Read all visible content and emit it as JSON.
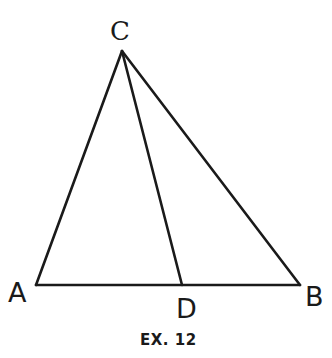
{
  "diagram": {
    "caption": "EX. 12",
    "points": {
      "A": {
        "label": "A",
        "x": 36,
        "y": 285
      },
      "B": {
        "label": "B",
        "x": 300,
        "y": 285
      },
      "C": {
        "label": "C",
        "x": 122,
        "y": 51
      },
      "D": {
        "label": "D",
        "x": 182,
        "y": 285
      }
    },
    "segments": [
      "AB",
      "AC",
      "BC",
      "CD"
    ],
    "colors": {
      "ink": "#1a1a1a",
      "background": "#ffffff"
    }
  }
}
